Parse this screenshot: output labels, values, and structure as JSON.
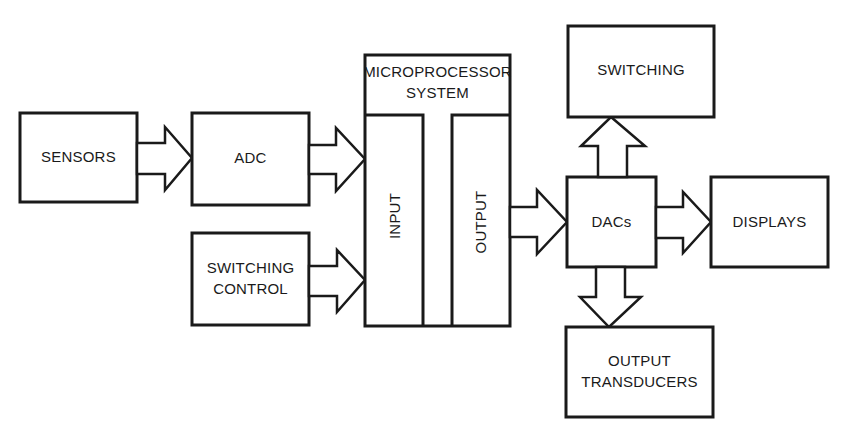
{
  "diagram": {
    "type": "block-diagram",
    "colors": {
      "stroke": "#1a1a1a",
      "fill": "#ffffff",
      "text": "#1a1a1a"
    },
    "blocks": {
      "sensors": {
        "label": "SENSORS"
      },
      "adc": {
        "label": "ADC"
      },
      "switching_control": {
        "line1": "SWITCHING",
        "line2": "CONTROL"
      },
      "microprocessor": {
        "line1": "MICROPROCESSOR",
        "line2": "SYSTEM",
        "input_label": "INPUT",
        "output_label": "OUTPUT"
      },
      "dacs": {
        "label": "DACs"
      },
      "switching": {
        "label": "SWITCHING"
      },
      "displays": {
        "label": "DISPLAYS"
      },
      "output_transducers": {
        "line1": "OUTPUT",
        "line2": "TRANSDUCERS"
      }
    },
    "connections": [
      {
        "from": "SENSORS",
        "to": "ADC"
      },
      {
        "from": "ADC",
        "to": "MICROPROCESSOR SYSTEM (INPUT)"
      },
      {
        "from": "SWITCHING CONTROL",
        "to": "MICROPROCESSOR SYSTEM (INPUT)"
      },
      {
        "from": "MICROPROCESSOR SYSTEM (OUTPUT)",
        "to": "DACs"
      },
      {
        "from": "DACs",
        "to": "SWITCHING"
      },
      {
        "from": "DACs",
        "to": "DISPLAYS"
      },
      {
        "from": "DACs",
        "to": "OUTPUT TRANSDUCERS"
      }
    ]
  }
}
